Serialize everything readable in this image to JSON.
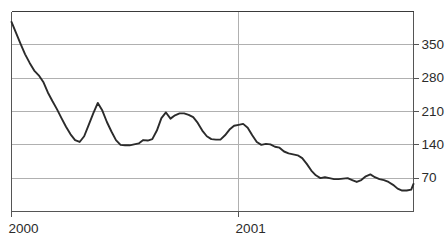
{
  "chart_data": {
    "type": "line",
    "title": "",
    "subtitle": "",
    "xlabel": "",
    "ylabel": "",
    "grid": true,
    "legend": null,
    "legend_position": "none",
    "line_color": "#2b2b2b",
    "grid_color": "#b0b0b0",
    "axis_color": "#555555",
    "background_color": "#ffffff",
    "y_axis_side": "right",
    "ylim": [
      0,
      420
    ],
    "yticks": [
      70,
      140,
      210,
      280,
      350
    ],
    "ytick_labels": [
      "70",
      "140",
      "210",
      "280",
      "350"
    ],
    "xlim": [
      2000.0,
      2001.77
    ],
    "xticks": [
      2000,
      2001
    ],
    "xtick_labels": [
      "2000",
      "2001"
    ],
    "series": [
      {
        "name": "price",
        "x": [
          2000.0,
          2000.02,
          2000.04,
          2000.06,
          2000.08,
          2000.1,
          2000.12,
          2000.14,
          2000.16,
          2000.18,
          2000.2,
          2000.22,
          2000.24,
          2000.26,
          2000.28,
          2000.3,
          2000.32,
          2000.34,
          2000.36,
          2000.38,
          2000.4,
          2000.42,
          2000.44,
          2000.46,
          2000.48,
          2000.5,
          2000.52,
          2000.54,
          2000.56,
          2000.58,
          2000.6,
          2000.62,
          2000.64,
          2000.66,
          2000.68,
          2000.7,
          2000.72,
          2000.74,
          2000.76,
          2000.78,
          2000.8,
          2000.82,
          2000.84,
          2000.86,
          2000.88,
          2000.9,
          2000.92,
          2000.94,
          2000.96,
          2000.98,
          2001.0,
          2001.02,
          2001.04,
          2001.06,
          2001.08,
          2001.1,
          2001.12,
          2001.14,
          2001.16,
          2001.18,
          2001.2,
          2001.22,
          2001.24,
          2001.26,
          2001.28,
          2001.3,
          2001.32,
          2001.34,
          2001.36,
          2001.38,
          2001.4,
          2001.42,
          2001.44,
          2001.46,
          2001.48,
          2001.5,
          2001.52,
          2001.54,
          2001.56,
          2001.58,
          2001.6,
          2001.62,
          2001.64,
          2001.66,
          2001.68,
          2001.7,
          2001.72,
          2001.74,
          2001.76,
          2001.77
        ],
        "values": [
          398,
          375,
          352,
          330,
          312,
          296,
          286,
          272,
          250,
          232,
          215,
          196,
          178,
          162,
          150,
          146,
          158,
          182,
          206,
          228,
          212,
          188,
          168,
          150,
          140,
          139,
          139,
          141,
          143,
          150,
          149,
          152,
          170,
          196,
          208,
          195,
          202,
          206,
          206,
          203,
          198,
          186,
          170,
          158,
          152,
          151,
          151,
          160,
          172,
          180,
          182,
          184,
          176,
          160,
          146,
          140,
          142,
          141,
          136,
          134,
          126,
          122,
          120,
          118,
          112,
          100,
          86,
          76,
          70,
          72,
          70,
          68,
          68,
          69,
          70,
          66,
          62,
          66,
          74,
          78,
          72,
          68,
          66,
          62,
          56,
          48,
          44,
          44,
          46,
          58
        ]
      }
    ]
  },
  "axis": {
    "y_ticks": [
      {
        "label": "350",
        "value": 350
      },
      {
        "label": "280",
        "value": 280
      },
      {
        "label": "210",
        "value": 210
      },
      {
        "label": "140",
        "value": 140
      },
      {
        "label": "70",
        "value": 70
      }
    ],
    "x_ticks": [
      {
        "label": "2000",
        "value": 2000
      },
      {
        "label": "2001",
        "value": 2001
      }
    ]
  }
}
